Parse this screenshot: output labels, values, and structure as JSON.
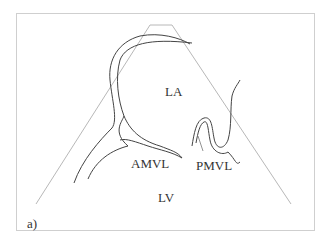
{
  "diagram": {
    "labels": {
      "la": "LA",
      "amvl": "AMVL",
      "pmvl": "PMVL",
      "lv": "LV",
      "panel": "a)"
    },
    "colors": {
      "frame": "#cfcfcf",
      "sector": "#b8b8b8",
      "outline": "#444444",
      "text": "#333333"
    }
  }
}
